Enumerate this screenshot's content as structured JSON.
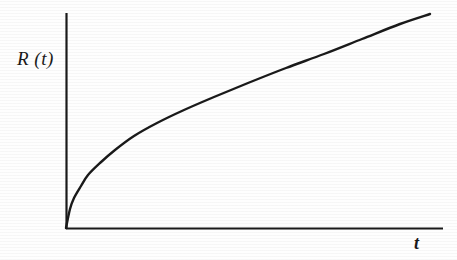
{
  "figure": {
    "background_color": "#fefefe",
    "ink_color": "#1a1a1a",
    "width": 457,
    "height": 260
  },
  "labels": {
    "y_axis": "R (t)",
    "x_axis": "t"
  },
  "chart_data": {
    "type": "line",
    "title": "",
    "xlabel": "t",
    "ylabel": "R (t)",
    "grid": false,
    "legend": null,
    "tick_labels": {
      "x": [],
      "y": []
    },
    "axis_style": {
      "y_axis_pixel_top": 13,
      "y_axis_pixel_bottom": 228,
      "x_axis_pixel_left": 66,
      "x_axis_pixel_right": 443,
      "line_width": 2,
      "arrowheads": false,
      "ticks": false
    },
    "xlim": [
      0,
      1
    ],
    "ylim": [
      0,
      1
    ],
    "series": [
      {
        "name": "R(t)",
        "color": "#1a1a1a",
        "x": [
          0.0,
          0.01,
          0.02,
          0.04,
          0.06,
          0.09,
          0.13,
          0.18,
          0.24,
          0.31,
          0.39,
          0.48,
          0.58,
          0.68,
          0.78,
          0.88,
          0.96
        ],
        "y": [
          0.0,
          0.09,
          0.14,
          0.2,
          0.25,
          0.31,
          0.37,
          0.43,
          0.49,
          0.55,
          0.61,
          0.68,
          0.75,
          0.81,
          0.88,
          0.94,
          0.99
        ],
        "pixel_points": [
          [
            66,
            228
          ],
          [
            70,
            209
          ],
          [
            74,
            198
          ],
          [
            81,
            186
          ],
          [
            88,
            175
          ],
          [
            100,
            163
          ],
          [
            115,
            150
          ],
          [
            134,
            136
          ],
          [
            157,
            123
          ],
          [
            184,
            110
          ],
          [
            214,
            97
          ],
          [
            248,
            83
          ],
          [
            286,
            68
          ],
          [
            324,
            54
          ],
          [
            362,
            39
          ],
          [
            400,
            24
          ],
          [
            430,
            14
          ]
        ]
      }
    ]
  }
}
